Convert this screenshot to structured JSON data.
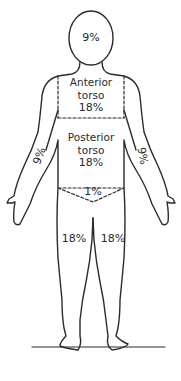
{
  "diagram": {
    "type": "rule-of-nines-body-chart",
    "regions": {
      "head": {
        "label": "9%"
      },
      "anterior_torso": {
        "name_line1": "Anterior",
        "name_line2": "torso",
        "label": "18%"
      },
      "posterior_torso": {
        "name_line1": "Posterior",
        "name_line2": "torso",
        "label": "18%"
      },
      "left_arm": {
        "label": "9%"
      },
      "right_arm": {
        "label": "9%"
      },
      "perineum": {
        "label": "1%"
      },
      "left_leg": {
        "label": "18%"
      },
      "right_leg": {
        "label": "18%"
      }
    },
    "colors": {
      "line": "#2b2b2b",
      "background": "#ffffff"
    }
  }
}
